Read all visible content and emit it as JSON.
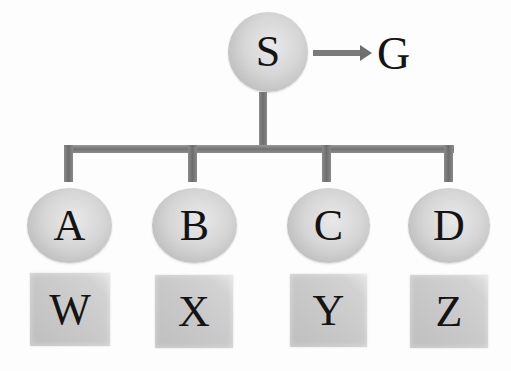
{
  "diagram": {
    "type": "hierarchy-tree",
    "root": {
      "label": "S",
      "shape": "circle",
      "arrow_target": {
        "label": "G"
      }
    },
    "children": [
      {
        "label": "A",
        "shape": "circle",
        "below": {
          "label": "W",
          "shape": "square"
        }
      },
      {
        "label": "B",
        "shape": "circle",
        "below": {
          "label": "X",
          "shape": "square"
        }
      },
      {
        "label": "C",
        "shape": "circle",
        "below": {
          "label": "Y",
          "shape": "square"
        }
      },
      {
        "label": "D",
        "shape": "circle",
        "below": {
          "label": "Z",
          "shape": "square"
        }
      }
    ],
    "colors": {
      "node_fill": "#d0d0d0",
      "connector": "#7a7a7a",
      "text": "#141414",
      "background": "#ffffff"
    }
  }
}
